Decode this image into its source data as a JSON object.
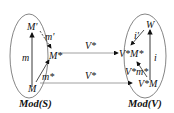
{
  "diagram": {
    "left": {
      "caption": "Mod(S)",
      "nodes": {
        "top": "M'",
        "mid": "M*",
        "bottom": "M"
      },
      "edges": {
        "vertical": "m",
        "top_to_mid": "m'",
        "bottom_to_mid": "m*"
      }
    },
    "right": {
      "caption": "Mod(V)",
      "nodes": {
        "top": "W",
        "mid": "V*M*",
        "bottom": "V*M"
      },
      "edges": {
        "vertical": "i",
        "top_to_mid": "i'",
        "bottom_to_mid": "V*m*"
      }
    },
    "functor": {
      "upper": "V*",
      "lower": "V*"
    },
    "colors": {
      "stroke": "#222222",
      "ellipse": "#555555",
      "line": "#888888"
    }
  }
}
